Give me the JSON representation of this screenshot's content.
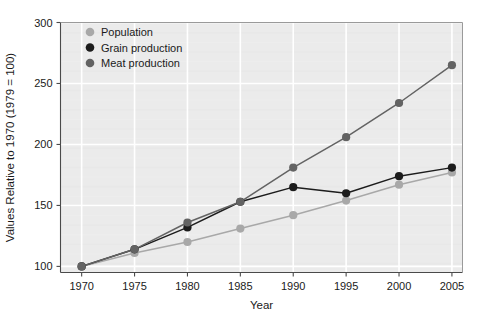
{
  "chart_data": {
    "type": "line",
    "title": "",
    "xlabel": "Year",
    "ylabel": "Values Relative to 1970 (1979 = 100)",
    "x": [
      1970,
      1975,
      1980,
      1985,
      1990,
      1995,
      2000,
      2005
    ],
    "xtick_labels": [
      "1970",
      "1975",
      "1980",
      "1985",
      "1990",
      "1995",
      "2000",
      "2005"
    ],
    "ytick_labels": [
      "100",
      "150",
      "200",
      "250",
      "300"
    ],
    "yticks": [
      100,
      150,
      200,
      250,
      300
    ],
    "xlim": [
      1968,
      2006
    ],
    "ylim": [
      95,
      300
    ],
    "grid": true,
    "legend_position": "top-left",
    "plot_background": "#ebebeb",
    "gridline_color": "#ffffff",
    "series": [
      {
        "name": "Population",
        "color": "#a8a8a8",
        "marker": "circle",
        "values": [
          100,
          111,
          120,
          131,
          142,
          154,
          167,
          177
        ]
      },
      {
        "name": "Grain production",
        "color": "#1c1c1c",
        "marker": "circle",
        "values": [
          100,
          114,
          132,
          153,
          165,
          160,
          174,
          181
        ]
      },
      {
        "name": "Meat production",
        "color": "#636363",
        "marker": "circle",
        "values": [
          100,
          114,
          136,
          153,
          181,
          206,
          234,
          265
        ]
      }
    ]
  }
}
